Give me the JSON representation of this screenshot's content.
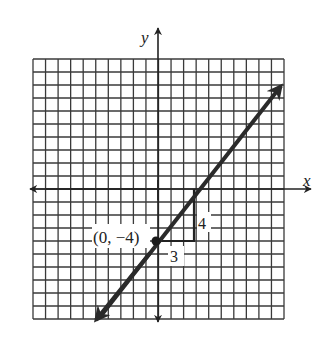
{
  "figure": {
    "axes": {
      "x_label": "x",
      "y_label": "y",
      "x_range": [
        -10,
        10
      ],
      "y_range": [
        -10,
        10
      ],
      "grid": true
    },
    "line": {
      "slope": "4/3",
      "y_intercept": -4,
      "equation": "y = (4/3)x - 4"
    },
    "point": {
      "label": "(0, −4)",
      "x": 0,
      "y": -4
    },
    "slope_triangle": {
      "run_label": "3",
      "rise_label": "4"
    },
    "colors": {
      "line": "#2a2a2a",
      "grid": "#3a3a3a",
      "background": "#ffffff"
    }
  }
}
